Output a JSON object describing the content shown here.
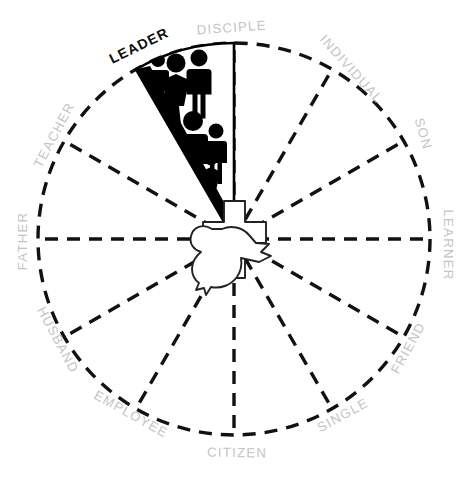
{
  "diagram": {
    "type": "radial-segment-wheel",
    "segment_count": 12,
    "center_emblem": {
      "name": "cross-and-dove",
      "cross_label": "cross",
      "dove_label": "dove"
    },
    "colors": {
      "label_default": "#c3c4c6",
      "label_highlight": "#0d0d0d",
      "line": "#111111",
      "highlight_fill": "#000000",
      "background": "#ffffff"
    },
    "segments": [
      {
        "label": "DISCIPLE",
        "highlighted": false
      },
      {
        "label": "INDIVIDUAL",
        "highlighted": false
      },
      {
        "label": "SON",
        "highlighted": false
      },
      {
        "label": "LEARNER",
        "highlighted": false
      },
      {
        "label": "FRIEND",
        "highlighted": false
      },
      {
        "label": "SINGLE",
        "highlighted": false
      },
      {
        "label": "CITIZEN",
        "highlighted": false
      },
      {
        "label": "EMPLOYEE",
        "highlighted": false
      },
      {
        "label": "HUSBAND",
        "highlighted": false
      },
      {
        "label": "FATHER",
        "highlighted": false
      },
      {
        "label": "TEACHER",
        "highlighted": false
      },
      {
        "label": "LEADER",
        "highlighted": true
      }
    ],
    "highlighted_segment": {
      "label": "LEADER",
      "icon": "group-of-people",
      "figure_count": 9
    }
  }
}
